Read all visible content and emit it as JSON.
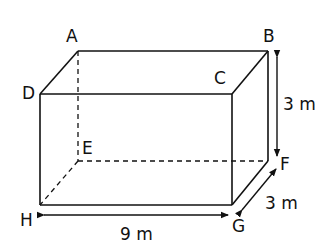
{
  "diagram": {
    "type": "rectangular-prism",
    "colors": {
      "line": "#111111",
      "background": "#ffffff"
    },
    "vertices": {
      "A": {
        "label": "A"
      },
      "B": {
        "label": "B"
      },
      "C": {
        "label": "C"
      },
      "D": {
        "label": "D"
      },
      "E": {
        "label": "E"
      },
      "F": {
        "label": "F"
      },
      "G": {
        "label": "G"
      },
      "H": {
        "label": "H"
      }
    },
    "dimensions": {
      "height": {
        "label": "3 m",
        "edge": "BF"
      },
      "length": {
        "label": "9 m",
        "edge": "HG"
      },
      "depth": {
        "label": "3 m",
        "edge": "GF"
      }
    },
    "hidden_edges": [
      "AE",
      "EF",
      "EH"
    ]
  }
}
